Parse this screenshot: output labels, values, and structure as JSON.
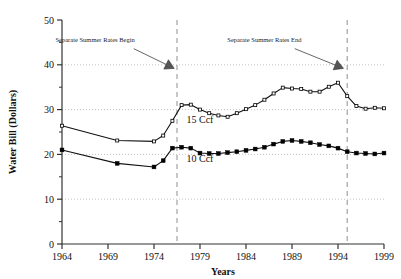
{
  "chart_data": {
    "type": "line",
    "title": "",
    "xlabel": "Years",
    "ylabel": "Water Bill (Dollars)",
    "xlim": [
      1964,
      1999
    ],
    "ylim": [
      0,
      50
    ],
    "grid": "horizontal-dotted",
    "legend_position": "inline-labels",
    "y_ticks": [
      0,
      10,
      20,
      30,
      40,
      50
    ],
    "y_tick_labels": [
      "0",
      "10",
      "20",
      "30",
      "40",
      "50"
    ],
    "y_minor_ticks": [
      5,
      15,
      25,
      35,
      45
    ],
    "x_ticks": [
      1964,
      1969,
      1974,
      1979,
      1984,
      1989,
      1994,
      1999
    ],
    "x_tick_labels": [
      "1964",
      "1969",
      "1974",
      "1979",
      "1984",
      "1989",
      "1994",
      "1999"
    ],
    "series": [
      {
        "name": "15 Ccf",
        "marker": "small-open-square",
        "label_x": 1979.0,
        "label_y": 27.0,
        "points": [
          {
            "x": 1964,
            "y": 26.4
          },
          {
            "x": 1970,
            "y": 23.1
          },
          {
            "x": 1974,
            "y": 22.9
          },
          {
            "x": 1975,
            "y": 24.2
          },
          {
            "x": 1976,
            "y": 27.5
          },
          {
            "x": 1977,
            "y": 31.0
          },
          {
            "x": 1978,
            "y": 31.1
          },
          {
            "x": 1979,
            "y": 30.0
          },
          {
            "x": 1980,
            "y": 29.2
          },
          {
            "x": 1981,
            "y": 28.7
          },
          {
            "x": 1982,
            "y": 28.4
          },
          {
            "x": 1983,
            "y": 29.2
          },
          {
            "x": 1984,
            "y": 30.1
          },
          {
            "x": 1985,
            "y": 31.0
          },
          {
            "x": 1986,
            "y": 32.2
          },
          {
            "x": 1987,
            "y": 33.6
          },
          {
            "x": 1988,
            "y": 34.9
          },
          {
            "x": 1989,
            "y": 34.7
          },
          {
            "x": 1990,
            "y": 34.6
          },
          {
            "x": 1991,
            "y": 34.0
          },
          {
            "x": 1992,
            "y": 34.0
          },
          {
            "x": 1993,
            "y": 35.1
          },
          {
            "x": 1994,
            "y": 36.0
          },
          {
            "x": 1995,
            "y": 33.0
          },
          {
            "x": 1996,
            "y": 30.8
          },
          {
            "x": 1997,
            "y": 30.2
          },
          {
            "x": 1998,
            "y": 30.4
          },
          {
            "x": 1999,
            "y": 30.3
          }
        ]
      },
      {
        "name": "10 Ccf",
        "marker": "filled-square",
        "label_x": 1979.0,
        "label_y": 18.4,
        "points": [
          {
            "x": 1964,
            "y": 21.0
          },
          {
            "x": 1970,
            "y": 18.0
          },
          {
            "x": 1974,
            "y": 17.2
          },
          {
            "x": 1975,
            "y": 18.6
          },
          {
            "x": 1976,
            "y": 21.4
          },
          {
            "x": 1977,
            "y": 21.6
          },
          {
            "x": 1978,
            "y": 21.4
          },
          {
            "x": 1979,
            "y": 20.3
          },
          {
            "x": 1980,
            "y": 20.2
          },
          {
            "x": 1981,
            "y": 20.2
          },
          {
            "x": 1982,
            "y": 20.4
          },
          {
            "x": 1983,
            "y": 20.6
          },
          {
            "x": 1984,
            "y": 20.9
          },
          {
            "x": 1985,
            "y": 21.2
          },
          {
            "x": 1986,
            "y": 21.6
          },
          {
            "x": 1987,
            "y": 22.3
          },
          {
            "x": 1988,
            "y": 22.9
          },
          {
            "x": 1989,
            "y": 23.1
          },
          {
            "x": 1990,
            "y": 22.9
          },
          {
            "x": 1991,
            "y": 22.6
          },
          {
            "x": 1992,
            "y": 22.2
          },
          {
            "x": 1993,
            "y": 21.9
          },
          {
            "x": 1994,
            "y": 21.4
          },
          {
            "x": 1995,
            "y": 20.6
          },
          {
            "x": 1996,
            "y": 20.3
          },
          {
            "x": 1997,
            "y": 20.2
          },
          {
            "x": 1998,
            "y": 20.1
          },
          {
            "x": 1999,
            "y": 20.3
          }
        ]
      }
    ],
    "vlines": [
      {
        "x": 1976.5,
        "style": "dashed",
        "color": "#999999"
      },
      {
        "x": 1995.0,
        "style": "dashed",
        "color": "#999999"
      }
    ],
    "annotations": [
      {
        "text": "Separate Summer Rates Begin",
        "text_x": 1967.6,
        "text_y": 45.2,
        "arrow_from_x": 1971.8,
        "arrow_from_y": 43.6,
        "arrow_to_x": 1976.2,
        "arrow_to_y": 39.2
      },
      {
        "text": "Separate Summer Rates End",
        "text_x": 1986.0,
        "text_y": 45.2,
        "arrow_from_x": 1989.3,
        "arrow_from_y": 43.6,
        "arrow_to_x": 1994.6,
        "arrow_to_y": 39.2
      }
    ],
    "colors": {
      "line": "#111111",
      "marker": "#000000",
      "grid": "#aaaaaa",
      "axis": "#333333",
      "vline": "#999999",
      "annotation_arrow": "#555555",
      "background": "#ffffff"
    }
  }
}
